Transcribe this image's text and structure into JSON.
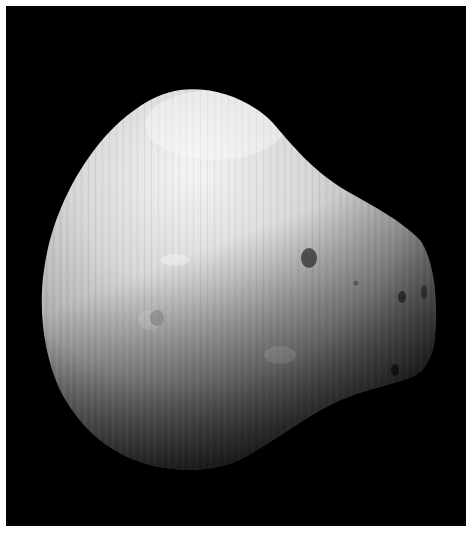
{
  "image": {
    "subject": "Deimos (moon of Mars)",
    "description": "Grayscale photograph of an irregular, potato-shaped moon lit from the upper left against a black background, with vertical striping artifacts and small craters on the right limb.",
    "background_color": "#000000",
    "frame_color": "#ffffff",
    "colors": {
      "highlight": "#f2f2f2",
      "midtone": "#a8a8a8",
      "shadow": "#3a3a3a"
    }
  },
  "caption": {
    "text": ""
  }
}
